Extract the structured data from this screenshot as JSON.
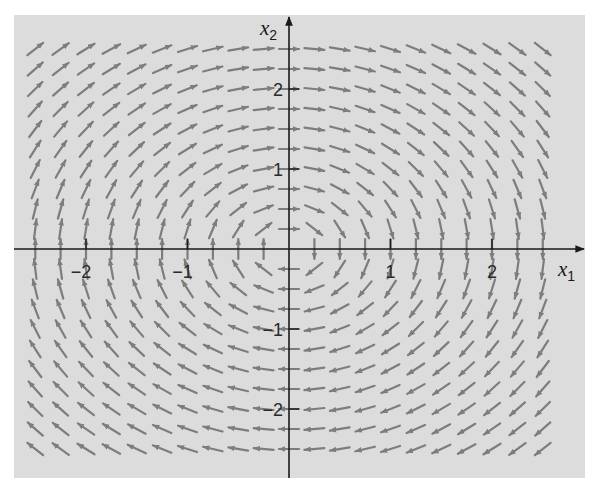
{
  "chart_data": {
    "type": "direction_field",
    "title": "",
    "system": {
      "dx1": "x2",
      "dx2": "-x1"
    },
    "rotation": "clockwise",
    "xlabel": "x1",
    "ylabel": "x2",
    "xlim": [
      -2.75,
      2.85
    ],
    "ylim": [
      -2.85,
      2.9
    ],
    "x_ticks": [
      -2,
      -1,
      1,
      2
    ],
    "y_ticks": [
      -2,
      -1,
      1,
      2
    ],
    "x_tick_labels": [
      "−2",
      "−1",
      "1",
      "2"
    ],
    "y_tick_labels": [
      "−2",
      "−1",
      "1",
      "2"
    ],
    "grid": false,
    "arrow_grid": {
      "x_start": -2.5,
      "x_end": 2.5,
      "y_start": -2.5,
      "y_end": 2.5,
      "step": 0.25
    },
    "arrows_normalized": true,
    "colors": {
      "panel_background": "#dcdcdc",
      "arrow": "#7d7d7d",
      "axis": "#1a1a1a",
      "page_background": "#ffffff"
    }
  },
  "axes": {
    "x_label_main": "x",
    "x_label_sub": "1",
    "y_label_main": "x",
    "y_label_sub": "2"
  }
}
